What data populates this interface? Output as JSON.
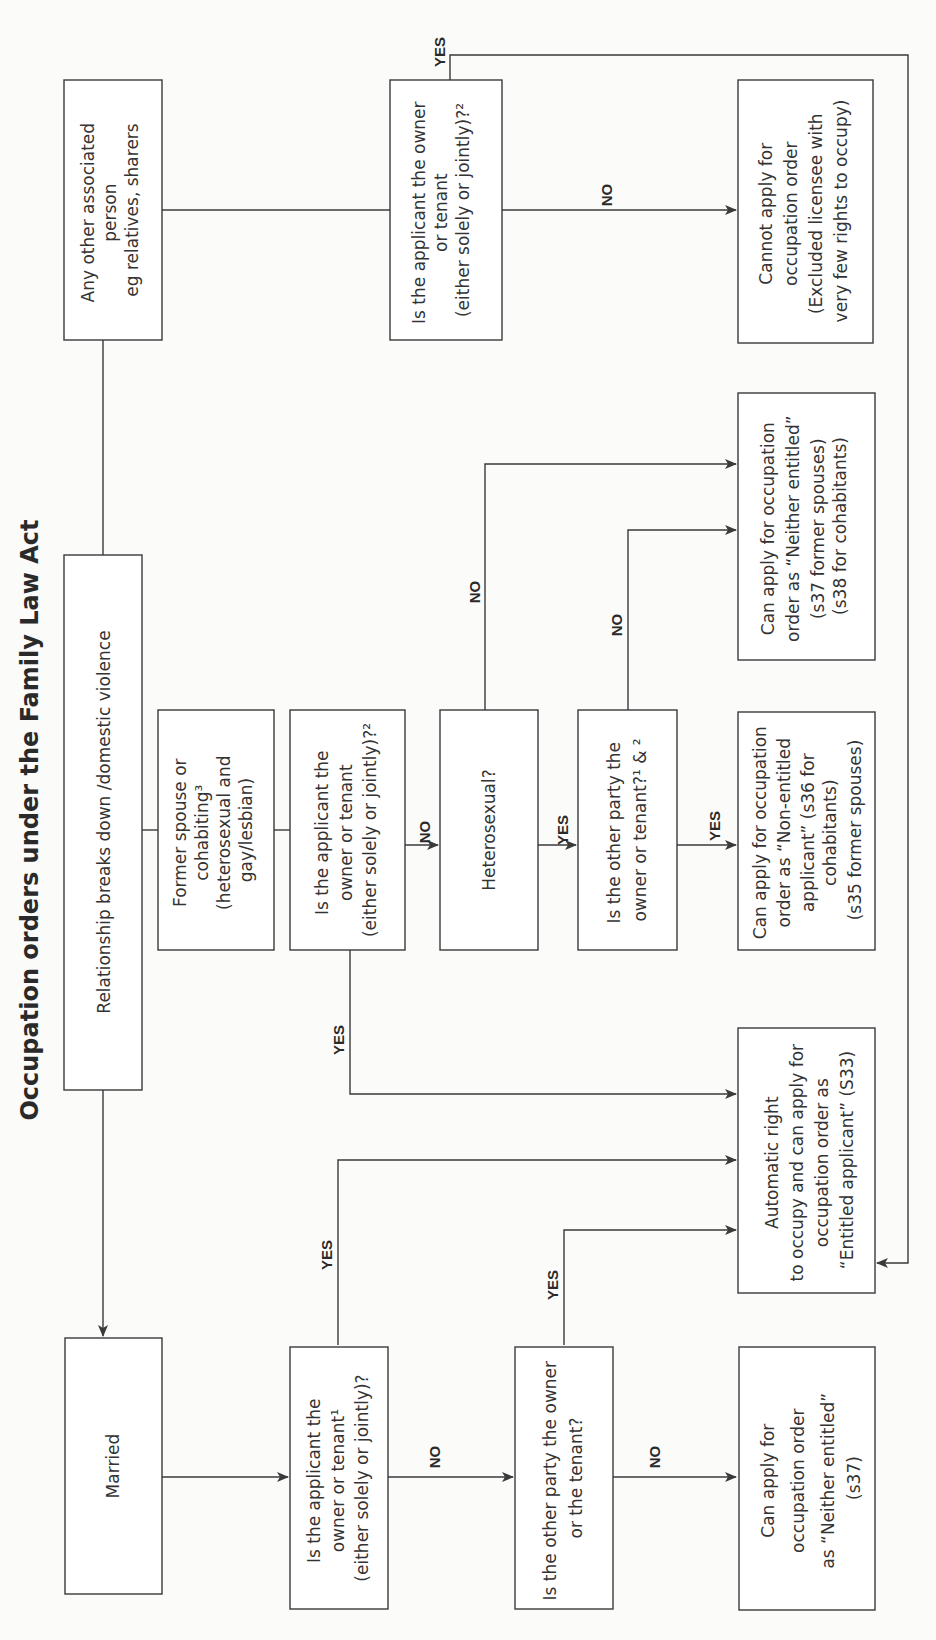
{
  "title": "Occupation orders under the Family Law Act",
  "nodes": {
    "start": {
      "lines": [
        "Relationship breaks down /domestic violence"
      ]
    },
    "other_person": {
      "lines": [
        "Any other associated",
        "person",
        "eg relatives, sharers"
      ]
    },
    "other_q_owner": {
      "lines": [
        "Is the applicant the owner",
        "or tenant",
        "(either solely or jointly)?²"
      ]
    },
    "cannot_apply": {
      "lines": [
        "Cannot apply for",
        "occupation order",
        "(Excluded licensee with",
        "very few rights to occupy)"
      ]
    },
    "former": {
      "lines": [
        "Former spouse or",
        "cohabiting³",
        "(heterosexual and",
        "gay/lesbian)"
      ]
    },
    "former_q_owner": {
      "lines": [
        "Is the applicant the",
        "owner or tenant",
        "(either solely or jointly)?²"
      ]
    },
    "heterosexual": {
      "lines": [
        "Heterosexual?"
      ]
    },
    "former_q_other": {
      "lines": [
        "Is the other party the",
        "owner or tenant?¹ & ²"
      ]
    },
    "neither_entitled_former": {
      "lines": [
        "Can apply for occupation",
        "order as “Neither entitled”",
        "(s37 former spouses)",
        "(s38 for cohabitants)"
      ]
    },
    "non_entitled": {
      "lines": [
        "Can apply for occupation",
        "order as “Non-entitled",
        "applicant” (s36 for",
        "cohabitants)",
        "(s35 former spouses)"
      ]
    },
    "automatic_right": {
      "lines": [
        "Automatic right",
        "to occupy and can apply for",
        "occupation order as",
        "“Entitled applicant”  (S33)"
      ]
    },
    "married": {
      "lines": [
        "Married"
      ]
    },
    "married_q_owner": {
      "lines": [
        "Is the applicant the",
        "owner or tenant¹",
        "(either solely or jointly)?"
      ]
    },
    "married_q_other": {
      "lines": [
        "Is the other party the owner",
        "or the tenant?"
      ]
    },
    "neither_entitled_married": {
      "lines": [
        "Can apply for",
        "occupation order",
        "as “Neither entitled”",
        "(s37)"
      ]
    }
  },
  "edge_labels": {
    "other_yes": "YES",
    "other_no": "NO",
    "former_owner_no": "NO",
    "former_owner_yes": "YES",
    "hetero_yes": "YES",
    "hetero_no": "NO",
    "former_other_yes": "YES",
    "former_other_no": "NO",
    "married_owner_yes": "YES",
    "married_owner_no": "NO",
    "married_other_yes": "YES",
    "married_other_no": "NO"
  },
  "colors": {
    "line": "#3a3a3a",
    "text": "#333333",
    "background": "#fbfbfa"
  }
}
